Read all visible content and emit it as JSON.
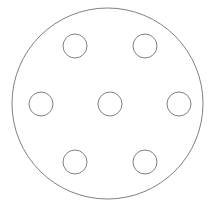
{
  "figure": {
    "background_color": "#ffffff",
    "stroke_color": "#808080",
    "stroke_width": 1,
    "canvas": {
      "width": 214,
      "height": 212
    }
  },
  "caption": {
    "text": ""
  },
  "chart_data": {
    "type": "diagram",
    "subtype": "engineering-line-drawing",
    "units": "px",
    "view": "plan",
    "grid": false,
    "legend": null,
    "xlim": [
      0,
      214
    ],
    "ylim": [
      0,
      212
    ],
    "shapes": [
      {
        "id": "plate-outline",
        "role": "outer-boundary",
        "type": "circle",
        "cx": 107.5,
        "cy": 103.5,
        "r": 95.5,
        "stroke": "#808080",
        "fill": "none"
      },
      {
        "id": "center-bore",
        "role": "central-hole",
        "type": "circle",
        "cx": 110,
        "cy": 104,
        "r": 12,
        "stroke": "#808080",
        "fill": "none"
      },
      {
        "id": "bolt-hole-1",
        "role": "bolt-hole",
        "type": "circle",
        "cx": 179,
        "cy": 104,
        "r": 12,
        "angle_deg": 0,
        "stroke": "#808080",
        "fill": "none"
      },
      {
        "id": "bolt-hole-2",
        "role": "bolt-hole",
        "type": "circle",
        "cx": 145,
        "cy": 46,
        "r": 12,
        "angle_deg": 60,
        "stroke": "#808080",
        "fill": "none"
      },
      {
        "id": "bolt-hole-3",
        "role": "bolt-hole",
        "type": "circle",
        "cx": 75,
        "cy": 46,
        "r": 12,
        "angle_deg": 120,
        "stroke": "#808080",
        "fill": "none"
      },
      {
        "id": "bolt-hole-4",
        "role": "bolt-hole",
        "type": "circle",
        "cx": 41,
        "cy": 104,
        "r": 12,
        "angle_deg": 180,
        "stroke": "#808080",
        "fill": "none"
      },
      {
        "id": "bolt-hole-5",
        "role": "bolt-hole",
        "type": "circle",
        "cx": 75,
        "cy": 162,
        "r": 12,
        "angle_deg": 240,
        "stroke": "#808080",
        "fill": "none"
      },
      {
        "id": "bolt-hole-6",
        "role": "bolt-hole",
        "type": "circle",
        "cx": 145,
        "cy": 162,
        "r": 12,
        "angle_deg": 300,
        "stroke": "#808080",
        "fill": "none"
      }
    ],
    "measurements": {
      "outer_diameter": 191,
      "outer_radius": 95.5,
      "center_bore_diameter": 24,
      "center_bore_radius": 12,
      "bolt_hole_diameter": 24,
      "bolt_hole_radius": 12,
      "bolt_circle_diameter": 138,
      "bolt_circle_radius": 69,
      "bolt_hole_count": 6,
      "bolt_hole_spacing_deg": 60
    },
    "annotations": []
  }
}
